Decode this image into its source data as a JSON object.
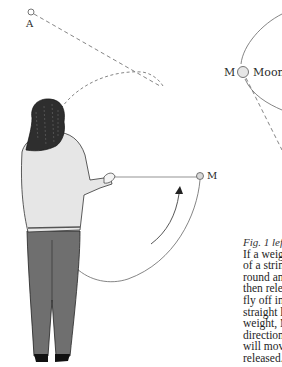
{
  "figure": {
    "point_a_label": "A",
    "moon_point_label": "M",
    "moon_label": "Moon",
    "weight_label": "M"
  },
  "caption": {
    "title": "Fig. 1 left",
    "lines": [
      "If a weigh",
      "of a string",
      "round and",
      "then relea",
      "fly off int",
      "straight li",
      "weight, M",
      "direction",
      "will move",
      "released."
    ]
  },
  "colors": {
    "line": "#555555",
    "sweater": "#e4e4e4",
    "jeans": "#6e6e6e",
    "hair": "#2a2a2a",
    "moon_fill": "#d8d8d8"
  }
}
